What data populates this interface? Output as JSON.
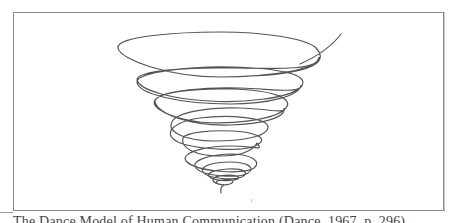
{
  "figure": {
    "caption": "The Dance Model of Human Communication (Dance, 1967, p. 296)",
    "frame_color": "#8a8a8a",
    "stroke_color": "#555555",
    "diagram_type": "helix"
  }
}
